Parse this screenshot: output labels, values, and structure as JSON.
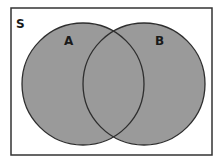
{
  "diagram": {
    "type": "venn",
    "universe": {
      "label": "S",
      "frame": {
        "x": 11,
        "y": 8,
        "width": 201,
        "height": 147
      },
      "stroke": "#333333",
      "fill": "#ffffff"
    },
    "sets": [
      {
        "label": "A",
        "cx": 83,
        "cy": 84,
        "r": 61,
        "label_x": 68,
        "label_y": 45
      },
      {
        "label": "B",
        "cx": 144,
        "cy": 84,
        "r": 61,
        "label_x": 159,
        "label_y": 45
      }
    ],
    "shaded_region": "A ∪ B",
    "colors": {
      "fill": "#9a9a9a",
      "outline": "#2e2e2e",
      "text": "#1a1a1a"
    }
  }
}
